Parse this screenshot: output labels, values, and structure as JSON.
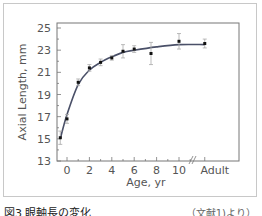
{
  "chart_data": {
    "type": "line",
    "title": "",
    "xlabel": "Age,  yr",
    "ylabel": "Axial Length,  mm",
    "x_tick_labels": [
      "0",
      "2",
      "4",
      "6",
      "8",
      "10",
      "Adult"
    ],
    "y_tick_labels": [
      "13",
      "15",
      "17",
      "19",
      "21",
      "23",
      "25"
    ],
    "ylim": [
      13,
      25
    ],
    "xlim": [
      -1,
      14
    ],
    "grid": false,
    "legend": null,
    "series": [
      {
        "name": "Measured axial length (mean ± SD)",
        "kind": "scatter-errorbar",
        "x": [
          -0.6,
          0,
          1,
          2,
          3,
          4,
          5,
          6,
          7.5,
          10,
          "Adult"
        ],
        "values": [
          15.1,
          16.8,
          20.1,
          21.4,
          21.9,
          22.3,
          22.9,
          23.1,
          22.7,
          23.8,
          23.6
        ],
        "error": [
          0.6,
          0.4,
          0.3,
          0.3,
          0.3,
          0.2,
          0.6,
          0.3,
          1.0,
          0.7,
          0.4
        ]
      },
      {
        "name": "Fitted growth curve",
        "kind": "line",
        "x": [
          -0.6,
          0,
          1,
          2,
          3,
          4,
          5,
          6,
          8,
          10,
          "Adult"
        ],
        "values": [
          15.0,
          17.2,
          19.9,
          21.2,
          21.9,
          22.4,
          22.8,
          23.0,
          23.3,
          23.5,
          23.5
        ]
      }
    ],
    "annotations": [
      "axis break between 10 and Adult"
    ]
  },
  "caption": {
    "figure_label": "図3 眼軸長の変化",
    "source": "（文献1)より）"
  }
}
